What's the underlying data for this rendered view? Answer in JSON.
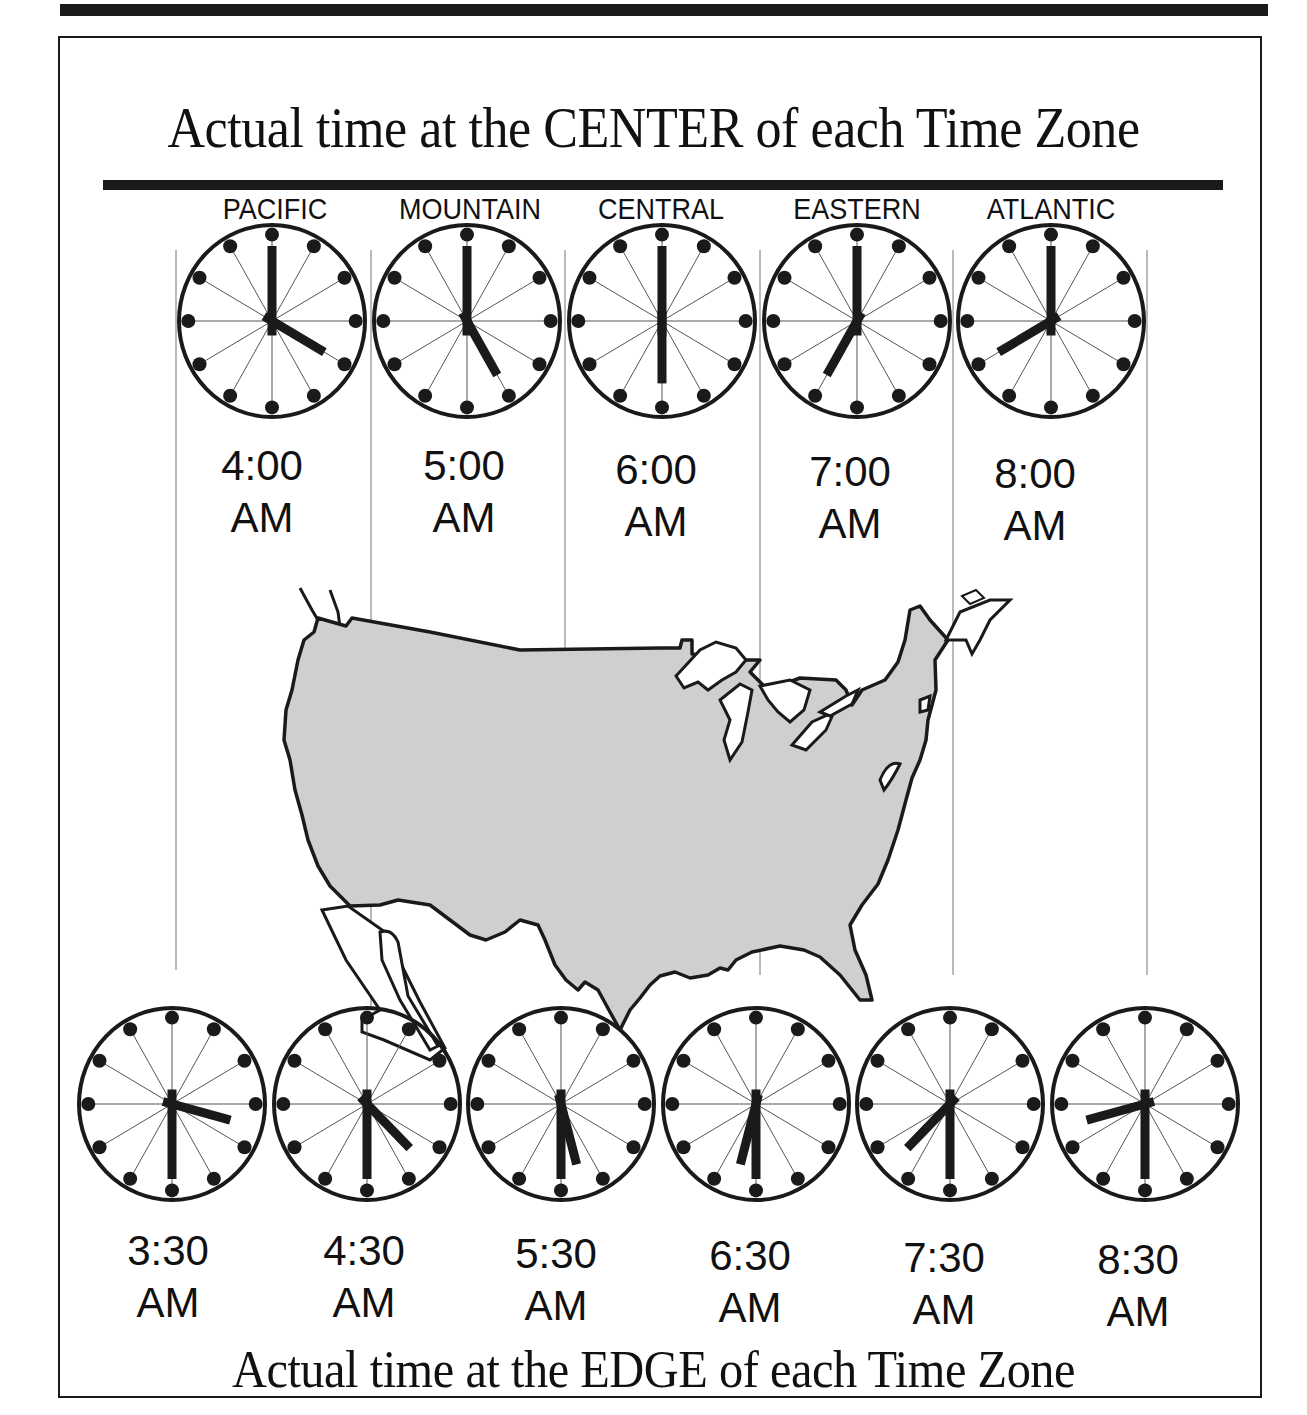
{
  "title_top": "Actual time at the CENTER of each Time Zone",
  "title_bottom": "Actual time at the EDGE of each Time Zone",
  "zones": [
    {
      "name": "PACIFIC",
      "center_time": "4:00",
      "center_period": "AM"
    },
    {
      "name": "MOUNTAIN",
      "center_time": "5:00",
      "center_period": "AM"
    },
    {
      "name": "CENTRAL",
      "center_time": "6:00",
      "center_period": "AM"
    },
    {
      "name": "EASTERN",
      "center_time": "7:00",
      "center_period": "AM"
    },
    {
      "name": "ATLANTIC",
      "center_time": "8:00",
      "center_period": "AM"
    }
  ],
  "edges": [
    {
      "time": "3:30",
      "period": "AM"
    },
    {
      "time": "4:30",
      "period": "AM"
    },
    {
      "time": "5:30",
      "period": "AM"
    },
    {
      "time": "6:30",
      "period": "AM"
    },
    {
      "time": "7:30",
      "period": "AM"
    },
    {
      "time": "8:30",
      "period": "AM"
    }
  ],
  "colors": {
    "ink": "#1a1a1a",
    "map_fill": "#cfcfcf",
    "background": "#ffffff"
  }
}
